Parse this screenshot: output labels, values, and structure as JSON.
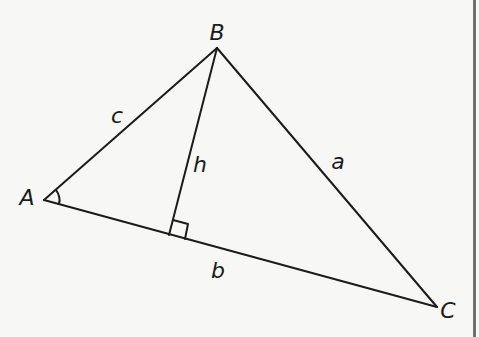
{
  "diagram": {
    "type": "triangle-with-altitude",
    "vertices": {
      "A": {
        "label": "A",
        "x": 44,
        "y": 200
      },
      "B": {
        "label": "B",
        "x": 217,
        "y": 48
      },
      "C": {
        "label": "C",
        "x": 437,
        "y": 307
      }
    },
    "altitude_foot": {
      "x": 169,
      "y": 235
    },
    "sides": {
      "a": {
        "label": "a",
        "from": "B",
        "to": "C"
      },
      "b": {
        "label": "b",
        "from": "A",
        "to": "C"
      },
      "c": {
        "label": "c",
        "from": "A",
        "to": "B"
      }
    },
    "altitude": {
      "label": "h",
      "from": "B",
      "to": "foot"
    },
    "markers": [
      "angle-arc-at-A",
      "right-angle-at-foot"
    ],
    "label_positions": {
      "A": {
        "x": 27,
        "y": 198
      },
      "B": {
        "x": 217,
        "y": 33
      },
      "C": {
        "x": 448,
        "y": 311
      },
      "a": {
        "x": 338,
        "y": 162
      },
      "b": {
        "x": 218,
        "y": 271
      },
      "c": {
        "x": 117,
        "y": 116
      },
      "h": {
        "x": 200,
        "y": 165
      }
    },
    "colors": {
      "stroke": "#1b1b1b",
      "background": "#f7f7f5",
      "frame": "#6f6f6f"
    }
  }
}
